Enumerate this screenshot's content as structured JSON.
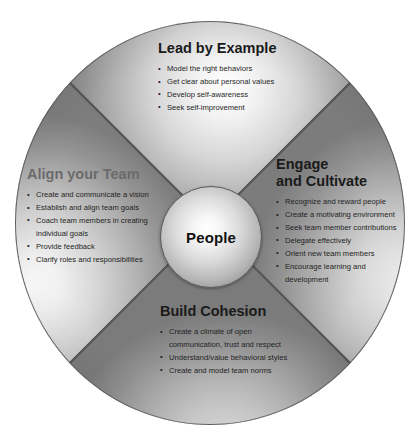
{
  "diagram": {
    "name": "leadership-wheel",
    "center": {
      "label": "People"
    },
    "colors": {
      "title_dark": "#1a1a1a",
      "title_muted": "#6b6b6b",
      "body_text": "#1f1f1f",
      "divider": "#4a4a4a",
      "wheel_rim": "#5d5d5d"
    },
    "sectors": [
      {
        "id": "top",
        "title": "Lead by Example",
        "title_style": "dark",
        "bullets": [
          "Model the right behaviors",
          "Get clear about personal values",
          "Develop self-awareness",
          "Seek self-improvement"
        ]
      },
      {
        "id": "right",
        "title_line1": "Engage",
        "title_line2": "and Cultivate",
        "title_style": "dark",
        "bullets": [
          "Recognize and reward people",
          "Create a motivating environment",
          "Seek team member contributions",
          "Delegate effectively",
          "Orient new team members",
          "Encourage learning and",
          "development"
        ]
      },
      {
        "id": "bottom",
        "title": "Build Cohesion",
        "title_style": "dark",
        "bullets": [
          "Create a climate of open",
          "communication, trust and respect",
          "Understand/value behavioral styles",
          "Create and model team norms"
        ]
      },
      {
        "id": "left",
        "title": "Align your Team",
        "title_style": "muted",
        "bullets": [
          "Create and communicate a vision",
          "Establish and align team goals",
          "Coach team members in creating",
          "individual goals",
          "Provide feedback",
          "Clarify roles and responsibilities"
        ]
      }
    ]
  }
}
